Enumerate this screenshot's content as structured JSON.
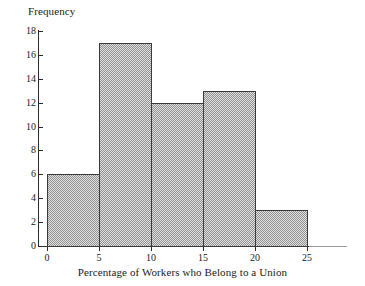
{
  "chart_data": {
    "type": "bar",
    "title": "",
    "xlabel": "Percentage of Workers who Belong to a Union",
    "ylabel": "Frequency",
    "bin_edges": [
      0,
      5,
      10,
      15,
      20,
      25
    ],
    "categories": [
      "0-5",
      "5-10",
      "10-15",
      "15-20",
      "20-25"
    ],
    "values": [
      6,
      17,
      12,
      13,
      3
    ],
    "x_ticks": [
      "0",
      "5",
      "10",
      "15",
      "20",
      "25"
    ],
    "x_tick_values": [
      0,
      5,
      10,
      15,
      20,
      25
    ],
    "y_ticks": [
      "0",
      "2",
      "4",
      "6",
      "8",
      "10",
      "12",
      "14",
      "16",
      "18"
    ],
    "y_tick_values": [
      0,
      2,
      4,
      6,
      8,
      10,
      12,
      14,
      16,
      18
    ],
    "xlim": [
      0,
      25
    ],
    "ylim": [
      0,
      18
    ],
    "grid": false,
    "legend": false,
    "bar_fill_color": "#c9c9c9",
    "bar_edge_color": "#3a3a3a",
    "axis_color": "#2b2b2b",
    "text_color": "#1a1a1a"
  }
}
